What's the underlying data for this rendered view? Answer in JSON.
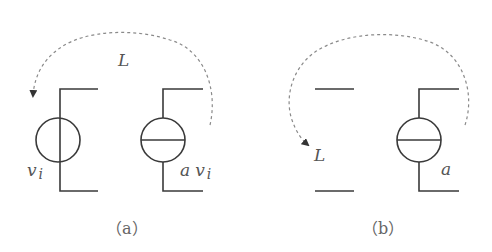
{
  "diagram": {
    "panel_a": {
      "caption": "（a）",
      "loop_label": "L",
      "left_source_label_var": "v",
      "left_source_label_sub": "i",
      "right_source_label_coef": "a",
      "right_source_label_var": "v",
      "right_source_label_sub": "i"
    },
    "panel_b": {
      "caption": "（b）",
      "loop_label": "L",
      "right_source_label": "a"
    },
    "colors": {
      "wire": "#3a3a3a",
      "dashed_loop": "#8a8a8a",
      "text": "#555555"
    }
  }
}
